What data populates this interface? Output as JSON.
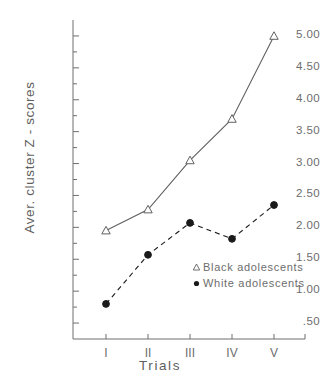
{
  "chart_data": {
    "type": "line",
    "title": "",
    "xlabel": "Trials",
    "ylabel": "Aver. cluster Z - scores",
    "categories": [
      "I",
      "II",
      "III",
      "IV",
      "V"
    ],
    "ylim": [
      0.25,
      5.25
    ],
    "yticks": [
      0.5,
      1.0,
      1.5,
      2.0,
      2.5,
      3.0,
      3.5,
      4.0,
      4.5,
      5.0
    ],
    "ytick_labels": [
      ".50",
      "1.00",
      "1.50",
      "2.00",
      "2.50",
      "3.00",
      "3.50",
      "4.00",
      "4.50",
      "5.00"
    ],
    "minor_ticks": true,
    "grid": false,
    "legend_position": "inside-lower-right",
    "series": [
      {
        "name": "Black adolescents",
        "marker": "open-triangle",
        "linestyle": "solid",
        "color": "#606060",
        "values": [
          1.95,
          2.28,
          3.05,
          3.7,
          5.0
        ]
      },
      {
        "name": "White adolescents",
        "marker": "filled-circle",
        "linestyle": "dashed",
        "color": "#1a1a1a",
        "values": [
          0.8,
          1.57,
          2.07,
          1.82,
          2.35
        ]
      }
    ]
  },
  "axis": {
    "ylabel": "Aver. cluster Z - scores",
    "xlabel": "Trials"
  },
  "legend": {
    "items": [
      {
        "label": "Black adolescents",
        "marker": "open-triangle"
      },
      {
        "label": "White adolescents",
        "marker": "filled-circle"
      }
    ]
  }
}
